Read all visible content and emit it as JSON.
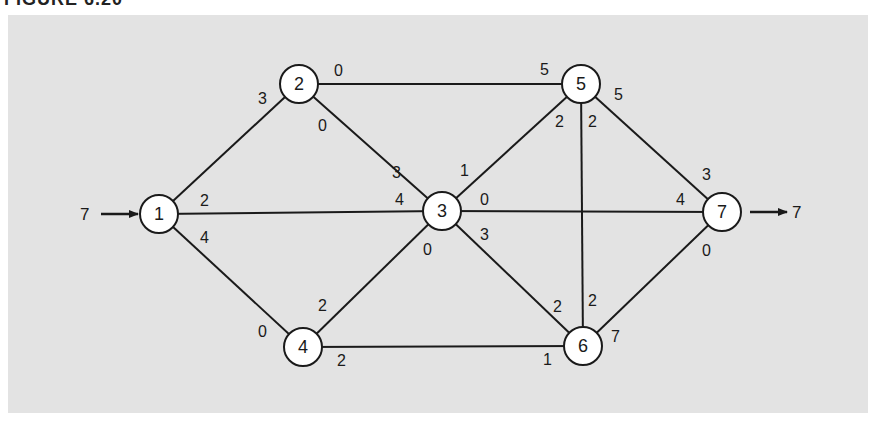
{
  "figure": {
    "title": "FIGURE 6.20",
    "panel_color": "#e3e3e3"
  },
  "network": {
    "source_flow": "7",
    "sink_flow": "7",
    "nodes": [
      {
        "id": "1",
        "label": "1",
        "x": 159,
        "y": 214
      },
      {
        "id": "2",
        "label": "2",
        "x": 299,
        "y": 84
      },
      {
        "id": "3",
        "label": "3",
        "x": 442,
        "y": 211
      },
      {
        "id": "4",
        "label": "4",
        "x": 303,
        "y": 347
      },
      {
        "id": "5",
        "label": "5",
        "x": 581,
        "y": 84
      },
      {
        "id": "6",
        "label": "6",
        "x": 583,
        "y": 346
      },
      {
        "id": "7",
        "label": "7",
        "x": 722,
        "y": 212
      }
    ],
    "edges": [
      {
        "from": "1",
        "to": "2",
        "cap_from": "3",
        "cap_to": ""
      },
      {
        "from": "1",
        "to": "3",
        "cap_from": "2",
        "cap_to": "4"
      },
      {
        "from": "1",
        "to": "4",
        "cap_from": "4",
        "cap_to": "0"
      },
      {
        "from": "2",
        "to": "5",
        "cap_from": "0",
        "cap_to": "5"
      },
      {
        "from": "2",
        "to": "3",
        "cap_from": "0",
        "cap_to": "3"
      },
      {
        "from": "3",
        "to": "5",
        "cap_from": "1",
        "cap_to": "2"
      },
      {
        "from": "3",
        "to": "7",
        "cap_from": "0",
        "cap_to": "4"
      },
      {
        "from": "3",
        "to": "6",
        "cap_from": "3",
        "cap_to": "2"
      },
      {
        "from": "4",
        "to": "3",
        "cap_from": "2",
        "cap_to": "0"
      },
      {
        "from": "4",
        "to": "6",
        "cap_from": "2",
        "cap_to": "1"
      },
      {
        "from": "5",
        "to": "6",
        "cap_from": "2",
        "cap_to": "2"
      },
      {
        "from": "5",
        "to": "7",
        "cap_from": "5",
        "cap_to": "3"
      },
      {
        "from": "6",
        "to": "7",
        "cap_from": "7",
        "cap_to": "0"
      }
    ],
    "labels": {
      "e12_at1": "3",
      "e13_at1": "2",
      "e13_at3": "4",
      "e14_at1": "4",
      "e14_at4": "0",
      "e25_at2": "0",
      "e25_at5": "5",
      "e23_at2": "0",
      "e23_at3": "3",
      "e35_at3": "1",
      "e35_at5": "2",
      "e37_at3": "0",
      "e37_at7": "4",
      "e36_at3": "3",
      "e36_at6": "2",
      "e43_at4": "2",
      "e43_at3": "0",
      "e46_at4": "2",
      "e46_at6": "1",
      "e56_at5": "2",
      "e56_at6": "2",
      "e57_at5": "5",
      "e57_at7": "3",
      "e67_at6": "7",
      "e67_at7": "0"
    }
  }
}
